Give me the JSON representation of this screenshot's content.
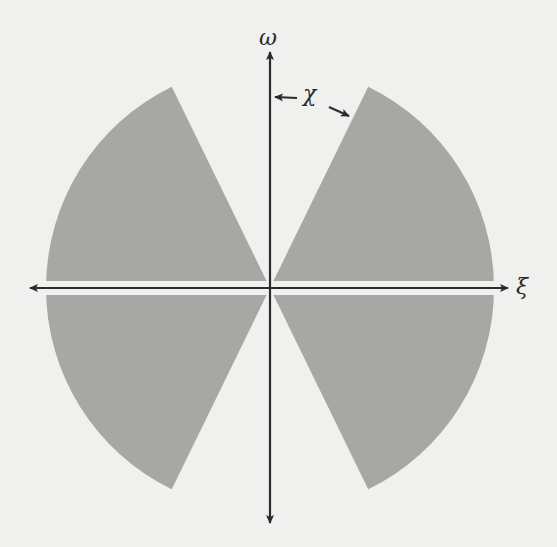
{
  "figure": {
    "axes": {
      "horizontal_label": "ξ",
      "vertical_label": "ω",
      "annotation_label": "χ"
    },
    "colors": {
      "background": "#f0f0ee",
      "wedge_fill": "#a7a7a5",
      "axis_stroke": "#2b2b2b"
    },
    "geometry": {
      "origin": [
        270,
        288
      ],
      "radius": 224,
      "wedge_half_angle_from_horizontal_deg": 64,
      "gap_band_half_height": 7
    },
    "regions": [
      {
        "name": "upper-right-wedge",
        "from_deg": 0,
        "to_deg": 64
      },
      {
        "name": "upper-left-wedge",
        "from_deg": 116,
        "to_deg": 180
      },
      {
        "name": "lower-left-wedge",
        "from_deg": 180,
        "to_deg": 244
      },
      {
        "name": "lower-right-wedge",
        "from_deg": 296,
        "to_deg": 360
      }
    ]
  }
}
